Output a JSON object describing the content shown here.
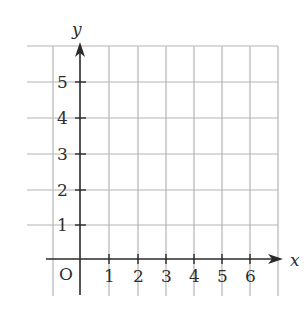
{
  "diagram": {
    "type": "coordinate-grid",
    "axes": {
      "x_label": "x",
      "y_label": "y",
      "origin_label": "O",
      "x_ticks": [
        "1",
        "2",
        "3",
        "4",
        "5",
        "6"
      ],
      "y_ticks": [
        "1",
        "2",
        "3",
        "4",
        "5"
      ]
    },
    "grid": {
      "x_range": [
        -1,
        7
      ],
      "y_range": [
        -1,
        6
      ],
      "grid_color": "#b4b4b4",
      "axis_color": "#2a2a2a"
    }
  }
}
